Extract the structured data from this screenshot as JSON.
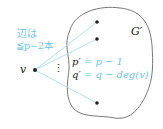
{
  "diagram": {
    "region_label": "G′",
    "vertex_label": "v",
    "edge_note_line1": "辺は",
    "edge_note_line2": "≦p−2本",
    "p_label": "p′",
    "p_eq": " = p − 1",
    "q_label": "q′",
    "q_eq": " = q − deg(v)",
    "ellipsis": "⋮",
    "colors": {
      "accent": "#6cc4de",
      "ink": "#222222",
      "edge": "#a9dbea"
    }
  }
}
